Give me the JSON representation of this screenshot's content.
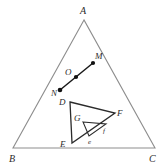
{
  "figure": {
    "background_color": "#ffffff",
    "stroke_color_outer": "#8d8d8d",
    "stroke_color_inner": "#2b2b2b",
    "label_color": "#2b2b2b",
    "width": 165,
    "height": 166
  },
  "outer_triangle": {
    "name": "triangle-ABC",
    "vertices": [
      {
        "label": "A",
        "x": 84,
        "y": 20,
        "label_x": 80,
        "label_y": 14
      },
      {
        "label": "B",
        "x": 13,
        "y": 148,
        "label_x": 9,
        "label_y": 162
      },
      {
        "label": "C",
        "x": 155,
        "y": 148,
        "label_x": 151,
        "label_y": 162
      }
    ],
    "path": "M 84 20 L 13 148 L 155 148 Z"
  },
  "segment_MN": {
    "name": "segment-MN",
    "path": "M 60 90 L 93 63",
    "endpoints": [
      {
        "label": "M",
        "x": 93,
        "y": 63,
        "label_x": 95,
        "label_y": 59,
        "dot": true
      },
      {
        "label": "N",
        "x": 60,
        "y": 90,
        "label_x": 52,
        "label_y": 95,
        "dot": true
      }
    ],
    "interior_point": {
      "label": "O",
      "x": 76,
      "y": 77,
      "label_x": 66,
      "label_y": 75,
      "dot": true
    }
  },
  "inner_triangle": {
    "name": "triangle-DEF",
    "path": "M 70 102 L 115 113 L 72 143 Z",
    "vertices": [
      {
        "label": "D",
        "x": 70,
        "y": 102,
        "label_x": 60,
        "label_y": 104
      },
      {
        "label": "E",
        "x": 72,
        "y": 143,
        "label_x": 61,
        "label_y": 146
      },
      {
        "label": "F",
        "x": 115,
        "y": 113,
        "label_x": 117,
        "label_y": 114
      }
    ],
    "interior_label": {
      "label": "G",
      "label_x": 76,
      "label_y": 120
    }
  },
  "small_triangle": {
    "name": "triangle-efg",
    "path": "M 83 122 L 106 124 L 89 136 Z",
    "vertices": [
      {
        "label": "e",
        "x": 89,
        "y": 136,
        "label_x": 89,
        "label_y": 143
      },
      {
        "label": "f",
        "x": 106,
        "y": 124,
        "label_x": 104,
        "label_y": 132
      }
    ]
  },
  "graph_data": {
    "type": "diagram",
    "description": "An outer triangle ABC contains a directed segment from N to M passing through point O, an inner triangle DEF, and a smaller nested triangle with vertices labeled e and f near region G."
  }
}
